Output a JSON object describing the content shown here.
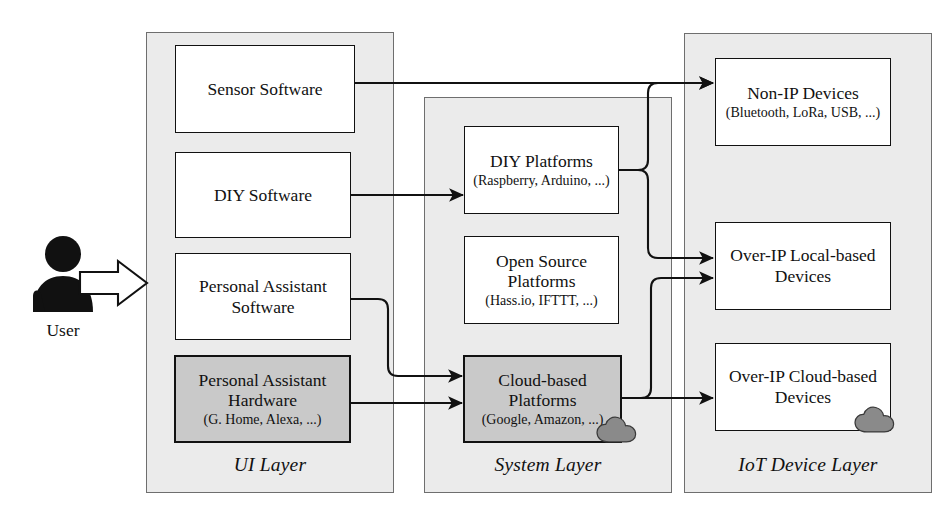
{
  "diagram": {
    "colors": {
      "layer_fill": "#ebebeb",
      "layer_border": "#6e6e6e",
      "node_fill": "#ffffff",
      "node_border": "#111111",
      "shaded_fill": "#c9c9c9",
      "cloud_fill": "#8a8a8a",
      "arrow": "#111111"
    }
  },
  "actor": {
    "icon": "user-person-icon",
    "label": "User",
    "arrow_icon": "block-arrow-right-icon"
  },
  "layers": [
    {
      "id": "ui",
      "label": "UI Layer",
      "nodes": [
        {
          "id": "sensor-software",
          "title": "Sensor Software",
          "subtitle": "",
          "shaded": false
        },
        {
          "id": "diy-software",
          "title": "DIY Software",
          "subtitle": "",
          "shaded": false
        },
        {
          "id": "personal-assistant-software",
          "title": "Personal Assistant\nSoftware",
          "subtitle": "",
          "shaded": false
        },
        {
          "id": "personal-assistant-hardware",
          "title": "Personal Assistant\nHardware",
          "subtitle": "(G. Home, Alexa, ...)",
          "shaded": true
        }
      ]
    },
    {
      "id": "system",
      "label": "System Layer",
      "nodes": [
        {
          "id": "diy-platforms",
          "title": "DIY Platforms",
          "subtitle": "(Raspberry, Arduino, ...)",
          "shaded": false,
          "cloud": false
        },
        {
          "id": "open-source-platforms",
          "title": "Open Source\nPlatforms",
          "subtitle": "(Hass.io, IFTTT, ...)",
          "shaded": false,
          "cloud": false
        },
        {
          "id": "cloud-based-platforms",
          "title": "Cloud-based\nPlatforms",
          "subtitle": "(Google, Amazon, ...)",
          "shaded": true,
          "cloud": true
        }
      ]
    },
    {
      "id": "iot",
      "label": "IoT Device Layer",
      "nodes": [
        {
          "id": "non-ip-devices",
          "title": "Non-IP Devices",
          "subtitle": "(Bluetooth, LoRa, USB, ...)",
          "shaded": false,
          "cloud": false
        },
        {
          "id": "over-ip-local-devices",
          "title": "Over-IP Local-based\nDevices",
          "subtitle": "",
          "shaded": false,
          "cloud": false
        },
        {
          "id": "over-ip-cloud-devices",
          "title": "Over-IP Cloud-based\nDevices",
          "subtitle": "",
          "shaded": false,
          "cloud": true
        }
      ]
    }
  ],
  "connections": [
    {
      "id": "user-to-ui",
      "from": "user",
      "to": "ui-layer",
      "icon": "block-arrow-right-icon"
    },
    {
      "id": "sensor-software-to-non-ip",
      "from": "sensor-software",
      "to": "non-ip-devices",
      "icon": "arrow-right-icon"
    },
    {
      "id": "diy-software-to-diy-platforms",
      "from": "diy-software",
      "to": "diy-platforms",
      "icon": "arrow-right-icon"
    },
    {
      "id": "pa-software-to-cloud-platforms",
      "from": "personal-assistant-software",
      "to": "cloud-based-platforms",
      "icon": "arrow-right-icon"
    },
    {
      "id": "pa-hardware-to-cloud-platforms",
      "from": "personal-assistant-hardware",
      "to": "cloud-based-platforms",
      "icon": "arrow-right-icon"
    },
    {
      "id": "diy-platforms-to-local-devices",
      "from": "diy-platforms",
      "to": "over-ip-local-devices",
      "icon": "arrow-right-icon"
    },
    {
      "id": "diy-platforms-to-non-ip",
      "from": "diy-platforms",
      "to": "non-ip-devices",
      "icon": "arrow-right-icon"
    },
    {
      "id": "cloud-platforms-to-local-devices",
      "from": "cloud-based-platforms",
      "to": "over-ip-local-devices",
      "icon": "arrow-right-icon"
    },
    {
      "id": "cloud-platforms-to-cloud-devices",
      "from": "cloud-based-platforms",
      "to": "over-ip-cloud-devices",
      "icon": "arrow-right-icon"
    }
  ]
}
